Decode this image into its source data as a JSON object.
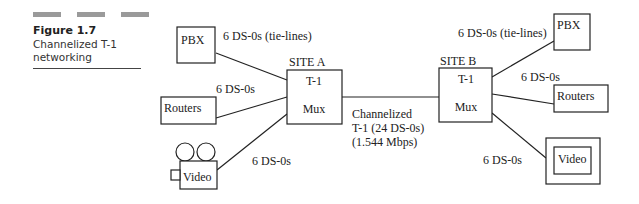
{
  "caption": {
    "figure_number": "Figure 1.7",
    "title_line1": "Channelized T-1",
    "title_line2": "networking"
  },
  "site_a": {
    "site_label": "SITE A",
    "mux_line1": "T-1",
    "mux_line2": "Mux",
    "pbx_label": "PBX",
    "pbx_link": "6 DS-0s (tie-lines)",
    "routers_label": "Routers",
    "routers_link": "6 DS-0s",
    "video_label": "Video",
    "video_link": "6 DS-0s"
  },
  "site_b": {
    "site_label": "SITE B",
    "mux_line1": "T-1",
    "mux_line2": "Mux",
    "pbx_label": "PBX",
    "pbx_link": "6 DS-0s (tie-lines)",
    "routers_label": "Routers",
    "routers_link": "6 DS-0s",
    "video_label": "Video",
    "video_link": "6 DS-0s"
  },
  "trunk": {
    "line1": "Channelized",
    "line2": "T-1 (24 DS-0s)",
    "line3": "(1.544 Mbps)"
  },
  "colors": {
    "stroke": "#222222",
    "caption_bar": "#9a9a9a"
  }
}
